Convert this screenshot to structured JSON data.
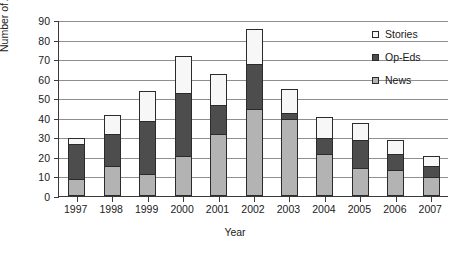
{
  "chart_data": {
    "type": "bar",
    "subtype": "stacked-bar",
    "title": "",
    "xlabel": "Year",
    "ylabel": "Number of Articles",
    "categories": [
      "1997",
      "1998",
      "1999",
      "2000",
      "2001",
      "2002",
      "2003",
      "2004",
      "2005",
      "2006",
      "2007"
    ],
    "ylim": [
      0,
      90
    ],
    "yticks": [
      0,
      10,
      20,
      30,
      40,
      50,
      60,
      70,
      80,
      90
    ],
    "ytick_labels": [
      "0",
      "10",
      "20",
      "30",
      "40",
      "50",
      "60",
      "70",
      "80",
      "90"
    ],
    "grid": "horizontal",
    "legend_position": "top-right",
    "series": [
      {
        "name": "News",
        "color": "#b3b3b3",
        "values": [
          8,
          15,
          11,
          20,
          31,
          44,
          39,
          21,
          14,
          13,
          9
        ]
      },
      {
        "name": "Op-Eds",
        "color": "#4d4d4d",
        "values": [
          18,
          16,
          27,
          32,
          15,
          23,
          3,
          8,
          14,
          8,
          6
        ]
      },
      {
        "name": "Stories",
        "color": "#f7f7f7",
        "values": [
          3,
          10,
          15,
          19,
          16,
          18,
          12,
          11,
          9,
          7,
          5
        ]
      }
    ],
    "totals": [
      29,
      41,
      53,
      71,
      62,
      85,
      54,
      40,
      37,
      28,
      20
    ],
    "stack_order_bottom_to_top": [
      "News",
      "Op-Eds",
      "Stories"
    ],
    "legend_order_top_to_bottom": [
      "Stories",
      "Op-Eds",
      "News"
    ]
  }
}
